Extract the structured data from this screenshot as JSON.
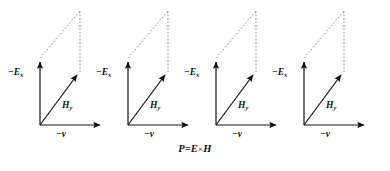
{
  "figure": {
    "background_color": "#ffffff",
    "stroke_color": "#111111",
    "dash_color": "#8c8c8c",
    "panel_count": 4,
    "panel_spacing_px": 88,
    "panels": [
      {
        "id": "panel-1",
        "labels": {
          "vertical_vector": "−E",
          "vertical_vector_sub": "x",
          "diagonal_vector": "H",
          "diagonal_vector_sub": "y",
          "horizontal_vector": "−v"
        }
      },
      {
        "id": "panel-2",
        "labels": {
          "vertical_vector": "−E",
          "vertical_vector_sub": "x",
          "diagonal_vector": "H",
          "diagonal_vector_sub": "y",
          "horizontal_vector": "−v"
        }
      },
      {
        "id": "panel-3",
        "labels": {
          "vertical_vector": "−E",
          "vertical_vector_sub": "x",
          "diagonal_vector": "H",
          "diagonal_vector_sub": "y",
          "horizontal_vector": "−v"
        }
      },
      {
        "id": "panel-4",
        "labels": {
          "vertical_vector": "−E",
          "vertical_vector_sub": "x",
          "diagonal_vector": "H",
          "diagonal_vector_sub": "y",
          "horizontal_vector": "−v"
        }
      }
    ],
    "caption": {
      "lhs": "P",
      "equals": "=",
      "rhs_first": "E",
      "operator": "×",
      "rhs_second": "H",
      "full": "P = E × H"
    }
  }
}
